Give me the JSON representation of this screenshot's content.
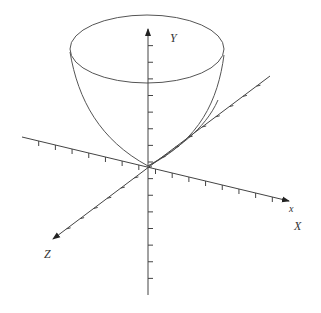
{
  "diagram": {
    "title": "",
    "type": "3d-paraboloid",
    "colors": {
      "line": "#444444",
      "surface": "#555555",
      "background": "#ffffff"
    },
    "labels": {
      "y_axis": "Y",
      "x_axis_lower": "x",
      "x_axis_upper": "X",
      "z_axis": "Z"
    },
    "axes": [
      {
        "name": "Y",
        "direction": "vertical",
        "ticks": 16
      },
      {
        "name": "X",
        "direction": "right-down",
        "ticks": 16
      },
      {
        "name": "Z",
        "direction": "left-down",
        "ticks": 16
      }
    ]
  }
}
